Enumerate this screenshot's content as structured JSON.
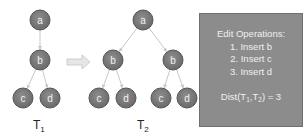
{
  "colors": {
    "node_fill": "#7a7a7a",
    "node_stroke": "#555555",
    "edge": "#c8c8c8",
    "arrow_fill": "#e6e6e6",
    "box_fill": "#8c8c8c",
    "box_text": "#f0f0f0"
  },
  "tree1": {
    "label": "T",
    "label_sub": "1",
    "nodes": [
      {
        "id": "a",
        "label": "a",
        "x": 40,
        "y": 20
      },
      {
        "id": "b",
        "label": "b",
        "x": 40,
        "y": 60
      },
      {
        "id": "c",
        "label": "c",
        "x": 23,
        "y": 98
      },
      {
        "id": "d",
        "label": "d",
        "x": 50,
        "y": 98
      }
    ],
    "edges": [
      [
        "a",
        "b"
      ],
      [
        "b",
        "c"
      ],
      [
        "b",
        "d"
      ]
    ]
  },
  "transform_arrow": {
    "icon": "right-arrow-icon"
  },
  "tree2": {
    "label": "T",
    "label_sub": "2",
    "nodes": [
      {
        "id": "a",
        "label": "a",
        "x": 143,
        "y": 20
      },
      {
        "id": "b1",
        "label": "b",
        "x": 113,
        "y": 60
      },
      {
        "id": "b2",
        "label": "b",
        "x": 173,
        "y": 60
      },
      {
        "id": "c1",
        "label": "c",
        "x": 99,
        "y": 98
      },
      {
        "id": "d1",
        "label": "d",
        "x": 126,
        "y": 98
      },
      {
        "id": "c2",
        "label": "c",
        "x": 161,
        "y": 98
      },
      {
        "id": "d2",
        "label": "d",
        "x": 187,
        "y": 98
      }
    ],
    "edges": [
      [
        "a",
        "b1"
      ],
      [
        "a",
        "b2"
      ],
      [
        "b1",
        "c1"
      ],
      [
        "b1",
        "d1"
      ],
      [
        "b2",
        "c2"
      ],
      [
        "b2",
        "d2"
      ]
    ]
  },
  "operations_box": {
    "title": "Edit Operations:",
    "items": [
      "1. Insert b",
      "2. Insert c",
      "3. Insert d"
    ],
    "dist_prefix": "Dist(T",
    "dist_sub1": "1",
    "dist_mid": ",T",
    "dist_sub2": "2",
    "dist_suffix": ") = 3"
  }
}
